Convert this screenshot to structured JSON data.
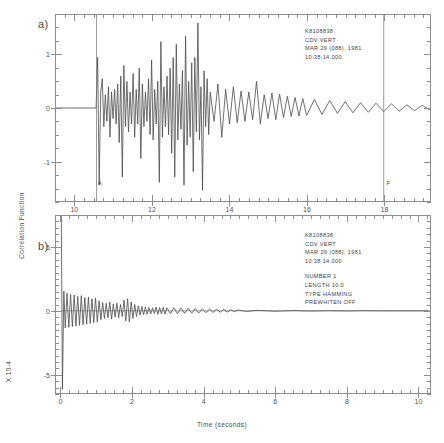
{
  "figure": {
    "xlabel": "Time (seconds)",
    "ylabel": "Correlation Function",
    "yscale_label": "X 10-4",
    "panel_a_letter": "a)",
    "panel_b_letter": "b)"
  },
  "annotation_a": {
    "station": "K8108838",
    "channel": "CDV  VERT",
    "date": "MAR 29 (088), 1981",
    "time": "10:38:14.000"
  },
  "annotation_b": {
    "station": "K8108838",
    "channel": "CDV  VERT",
    "date": "MAR 29 (088), 1981",
    "time": "10:38:14.000",
    "number": "NUMBER   1",
    "length": "LENGTH  10.0",
    "type": "TYPE HAMMING",
    "prewhiten": "PREWHITEN OFF"
  },
  "markers": {
    "a_marker": "A",
    "f_marker": "F"
  },
  "chart_data": [
    {
      "type": "line",
      "panel": "a",
      "title": "",
      "xlabel": "Time (seconds)",
      "ylabel": "",
      "xlim": [
        9.5,
        19.2
      ],
      "ylim": [
        -1.75,
        1.75
      ],
      "xticks": [
        10,
        12,
        14,
        16,
        18
      ],
      "xtick_labels": [
        "10",
        "12",
        "14",
        "16",
        "18"
      ],
      "xminor_step": 0.25,
      "yticks": [
        1,
        0,
        -1
      ],
      "ytick_labels": [
        "1",
        "0",
        "-1"
      ],
      "yminor_step": 0.25,
      "grid": false,
      "legend": "none",
      "annotations": [
        {
          "label": "A",
          "x": 10.55,
          "kind": "vertical-line-marker"
        },
        {
          "label": "F",
          "x": 18.0,
          "kind": "vertical-line-marker"
        }
      ],
      "description": "Vertical-component seismogram trace; flat zero baseline until arrival A at 10.55 s, then high-amplitude oscillation decaying into coda through 19 s.",
      "series": [
        {
          "name": "CDV VERT seismogram",
          "color": "#4a4a4a",
          "x": [
            9.5,
            9.8,
            10.1,
            10.4,
            10.54,
            10.58,
            10.62,
            10.66,
            10.7,
            10.74,
            10.78,
            10.82,
            10.86,
            10.9,
            10.94,
            10.98,
            11.02,
            11.06,
            11.1,
            11.14,
            11.18,
            11.22,
            11.26,
            11.3,
            11.34,
            11.38,
            11.42,
            11.46,
            11.5,
            11.54,
            11.58,
            11.62,
            11.66,
            11.7,
            11.74,
            11.78,
            11.82,
            11.86,
            11.9,
            11.94,
            11.98,
            12.02,
            12.06,
            12.1,
            12.14,
            12.18,
            12.22,
            12.26,
            12.3,
            12.34,
            12.38,
            12.42,
            12.46,
            12.5,
            12.54,
            12.58,
            12.62,
            12.66,
            12.7,
            12.74,
            12.78,
            12.82,
            12.86,
            12.9,
            12.94,
            12.98,
            13.02,
            13.06,
            13.1,
            13.14,
            13.18,
            13.22,
            13.26,
            13.3,
            13.34,
            13.38,
            13.42,
            13.46,
            13.5,
            13.6,
            13.7,
            13.8,
            13.9,
            14.0,
            14.1,
            14.2,
            14.3,
            14.4,
            14.5,
            14.6,
            14.7,
            14.8,
            14.9,
            15.0,
            15.1,
            15.2,
            15.3,
            15.4,
            15.5,
            15.6,
            15.7,
            15.8,
            15.9,
            16.0,
            16.2,
            16.4,
            16.6,
            16.8,
            17.0,
            17.2,
            17.4,
            17.6,
            17.8,
            18.0,
            18.2,
            18.4,
            18.6,
            18.8,
            19.0,
            19.2
          ],
          "y": [
            0.0,
            0.0,
            0.0,
            0.0,
            0.0,
            0.95,
            -1.45,
            0.3,
            0.55,
            -0.35,
            0.25,
            -0.25,
            0.4,
            -0.55,
            0.3,
            -0.2,
            0.35,
            -0.3,
            0.45,
            -0.65,
            0.6,
            -1.3,
            0.8,
            -0.35,
            0.5,
            -0.45,
            0.3,
            -0.3,
            0.65,
            -0.55,
            0.35,
            -0.3,
            0.75,
            -0.95,
            0.45,
            -0.35,
            0.3,
            -0.25,
            0.55,
            -0.5,
            0.9,
            -0.6,
            0.35,
            -0.3,
            0.5,
            -1.4,
            1.25,
            -0.55,
            0.4,
            -0.35,
            0.6,
            -0.5,
            0.75,
            -0.85,
            0.95,
            -1.3,
            1.2,
            -0.6,
            0.45,
            -0.4,
            0.7,
            -1.45,
            1.35,
            -0.7,
            0.5,
            -0.55,
            0.85,
            -1.2,
            0.95,
            -0.45,
            1.6,
            -0.6,
            0.4,
            -1.55,
            0.7,
            -0.35,
            0.55,
            -0.5,
            0.3,
            -0.25,
            0.45,
            -0.55,
            0.35,
            -0.3,
            0.4,
            -0.28,
            0.32,
            -0.25,
            0.3,
            -0.22,
            0.5,
            -0.3,
            0.25,
            -0.2,
            0.28,
            -0.22,
            0.26,
            -0.18,
            0.22,
            -0.16,
            0.2,
            -0.15,
            0.18,
            -0.14,
            0.16,
            -0.12,
            0.14,
            -0.1,
            0.12,
            -0.09,
            0.1,
            -0.08,
            0.09,
            -0.07,
            0.08,
            -0.06,
            0.06,
            -0.05,
            0.05,
            -0.04
          ]
        }
      ]
    },
    {
      "type": "line",
      "panel": "b",
      "title": "",
      "xlabel": "Time (seconds)",
      "ylabel": "Correlation Function",
      "yscale": "X 10-4",
      "xlim": [
        -0.15,
        10.35
      ],
      "ylim": [
        -6.5,
        7.5
      ],
      "xticks": [
        0,
        2,
        4,
        6,
        8,
        10
      ],
      "xtick_labels": [
        "0",
        "2",
        "4",
        "6",
        "8",
        "10"
      ],
      "xminor_step": 0.25,
      "yticks": [
        5,
        0,
        -5
      ],
      "ytick_labels": [
        "5",
        "0",
        "-5"
      ],
      "yminor_step": 0.5,
      "grid": false,
      "legend": "none",
      "parameters": {
        "number": 1,
        "length": 10.0,
        "window_type": "HAMMING",
        "prewhiten": "OFF"
      },
      "description": "Autocorrelation function: large positive spike off-scale at zero lag, immediate deep negative excursion, then rapidly decaying ringing that flattens to zero beyond about 5 seconds.",
      "series": [
        {
          "name": "Autocorrelation",
          "color": "#4a4a4a",
          "x": [
            0.0,
            0.03,
            0.07,
            0.11,
            0.16,
            0.21,
            0.26,
            0.31,
            0.36,
            0.41,
            0.46,
            0.51,
            0.56,
            0.61,
            0.66,
            0.71,
            0.76,
            0.81,
            0.86,
            0.91,
            0.96,
            1.01,
            1.06,
            1.11,
            1.16,
            1.21,
            1.26,
            1.31,
            1.36,
            1.41,
            1.46,
            1.51,
            1.56,
            1.61,
            1.66,
            1.71,
            1.76,
            1.81,
            1.86,
            1.91,
            1.96,
            2.01,
            2.06,
            2.11,
            2.16,
            2.21,
            2.26,
            2.31,
            2.36,
            2.41,
            2.46,
            2.51,
            2.56,
            2.61,
            2.66,
            2.71,
            2.76,
            2.81,
            2.86,
            2.91,
            2.96,
            3.06,
            3.16,
            3.26,
            3.36,
            3.46,
            3.56,
            3.66,
            3.76,
            3.86,
            3.96,
            4.06,
            4.16,
            4.26,
            4.36,
            4.46,
            4.56,
            4.66,
            4.76,
            4.86,
            4.96,
            5.2,
            5.5,
            6.0,
            6.5,
            7.0,
            7.5,
            8.0,
            8.5,
            9.0,
            9.5,
            10.0,
            10.3
          ],
          "y": [
            7.5,
            -6.2,
            1.55,
            -1.35,
            1.4,
            -1.3,
            1.3,
            -1.25,
            1.25,
            -1.2,
            1.15,
            -1.15,
            1.2,
            -1.1,
            1.05,
            -1.05,
            1.1,
            -1.0,
            0.95,
            -0.95,
            1.0,
            -0.9,
            0.8,
            -0.7,
            0.65,
            -0.6,
            0.6,
            -0.55,
            0.7,
            -0.65,
            0.55,
            -0.5,
            0.6,
            -0.55,
            0.5,
            -0.45,
            0.85,
            -0.8,
            0.95,
            -0.9,
            0.7,
            -0.6,
            0.5,
            -0.45,
            0.4,
            -0.35,
            0.35,
            -0.3,
            0.3,
            -0.28,
            0.26,
            -0.25,
            0.24,
            -0.22,
            0.3,
            -0.28,
            0.26,
            -0.24,
            0.28,
            -0.26,
            0.24,
            -0.22,
            0.25,
            -0.23,
            0.22,
            -0.2,
            0.21,
            -0.19,
            0.18,
            -0.17,
            0.16,
            -0.15,
            0.14,
            -0.13,
            0.12,
            -0.11,
            0.1,
            -0.09,
            0.08,
            -0.07,
            0.07,
            -0.05,
            0.04,
            -0.03,
            0.02,
            -0.02,
            0.01,
            -0.01,
            0.01,
            0.0,
            0.0,
            0.0,
            0.0
          ]
        }
      ]
    }
  ]
}
